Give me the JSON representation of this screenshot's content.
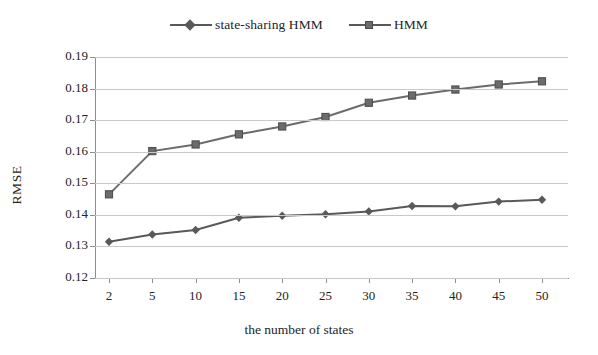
{
  "legend": {
    "position": "top-center",
    "entries": [
      {
        "label": "state-sharing HMM",
        "marker": "diamond",
        "color": "#595959"
      },
      {
        "label": "HMM",
        "marker": "square",
        "color": "#6b6b6b"
      }
    ]
  },
  "axes": {
    "y_title": "RMSE",
    "x_title": "the number of states",
    "y_ticks": [
      "0.19",
      "0.18",
      "0.17",
      "0.16",
      "0.15",
      "0.14",
      "0.13",
      "0.12"
    ],
    "x_ticks": [
      "2",
      "5",
      "10",
      "15",
      "20",
      "25",
      "30",
      "35",
      "40",
      "45",
      "50"
    ]
  },
  "chart_data": {
    "type": "line",
    "title": "",
    "subtitle": "",
    "xlabel": "the number of states",
    "ylabel": "RMSE",
    "categories": [
      "2",
      "5",
      "10",
      "15",
      "20",
      "25",
      "30",
      "35",
      "40",
      "45",
      "50"
    ],
    "x": [
      2,
      5,
      10,
      15,
      20,
      25,
      30,
      35,
      40,
      45,
      50
    ],
    "ylim": [
      0.12,
      0.19
    ],
    "ytick_values": [
      0.12,
      0.13,
      0.14,
      0.15,
      0.16,
      0.17,
      0.18,
      0.19
    ],
    "grid": true,
    "grid_axis": "y",
    "legend_position": "top-center",
    "series": [
      {
        "name": "state-sharing HMM",
        "marker": "diamond",
        "color": "#595959",
        "values": [
          0.1315,
          0.1338,
          0.1352,
          0.1391,
          0.1397,
          0.1402,
          0.1411,
          0.1428,
          0.1427,
          0.1442,
          0.1448
        ]
      },
      {
        "name": "HMM",
        "marker": "square",
        "color": "#6b6b6b",
        "values": [
          0.1465,
          0.1602,
          0.1623,
          0.1655,
          0.168,
          0.171,
          0.1755,
          0.1778,
          0.1797,
          0.1813,
          0.1823
        ]
      }
    ]
  },
  "colors": {
    "background": "#ffffff",
    "grid": "#c9c9c9",
    "axis": "#8e8e8e",
    "text": "#242424",
    "series_1": "#595959",
    "series_2": "#6b6b6b"
  }
}
